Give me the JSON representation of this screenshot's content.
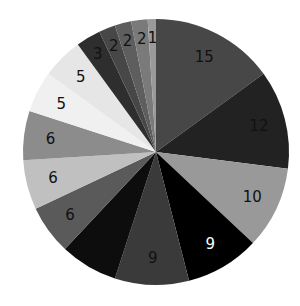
{
  "chart_data": {
    "type": "pie",
    "title": "",
    "start_angle_deg": 0,
    "direction": "clockwise",
    "values": [
      15,
      12,
      10,
      9,
      9,
      7,
      6,
      6,
      6,
      5,
      5,
      3,
      2,
      2,
      2,
      1
    ],
    "labels": [
      "15",
      "12",
      "10",
      "9",
      "9",
      "",
      "6",
      "6",
      "6",
      "5",
      "5",
      "3",
      "2",
      "2",
      "2",
      "1"
    ],
    "colors": [
      "#474747",
      "#222222",
      "#999999",
      "#000000",
      "#3a3a3a",
      "#0d0d0d",
      "#5a5a5a",
      "#c0c0c0",
      "#8c8c8c",
      "#f0f0f0",
      "#e6e6e6",
      "#2e2e2e",
      "#474747",
      "#5e5e5e",
      "#7a7a7a",
      "#9a9a9a"
    ],
    "label_colors": [
      "#111111",
      "#111111",
      "#111111",
      "#ffffff",
      "#111111",
      "#111111",
      "#111111",
      "#111111",
      "#111111",
      "#111111",
      "#111111",
      "#111111",
      "#111111",
      "#111111",
      "#111111",
      "#111111"
    ],
    "legend": null,
    "grid": false
  },
  "geometry": {
    "cx": 156,
    "cy": 152,
    "r": 133
  }
}
